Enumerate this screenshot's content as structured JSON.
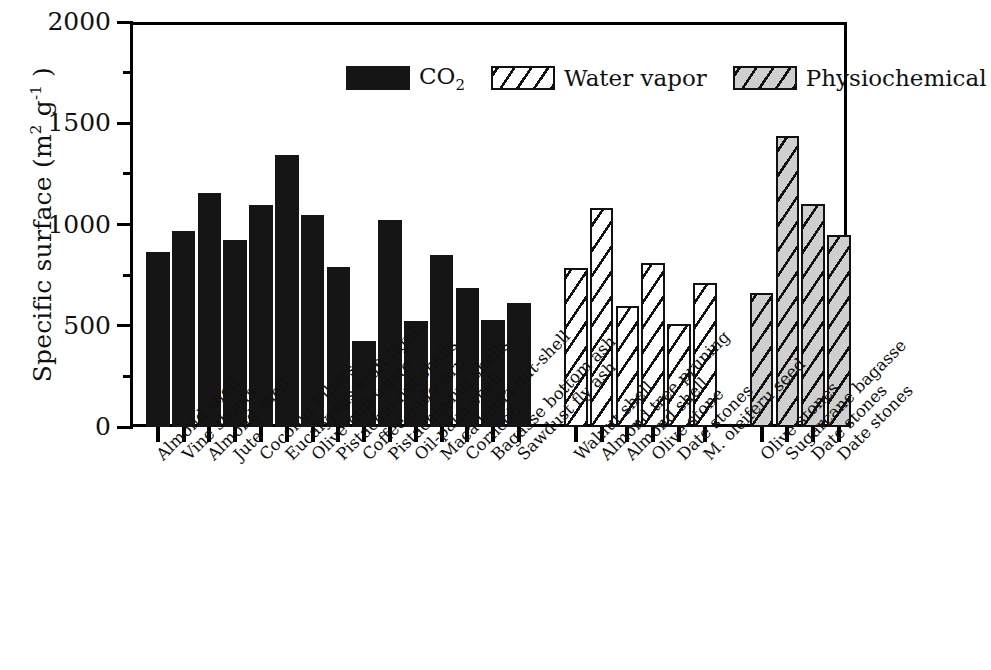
{
  "chart_data": {
    "type": "bar",
    "title": "",
    "xlabel": "",
    "ylabel": "Specific surface (m² g⁻¹)",
    "ylabel_main": "Specific surface (m",
    "ylabel_sup1": "2",
    "ylabel_mid": " g",
    "ylabel_sup2": "-1",
    "ylabel_end": " )",
    "ylim": [
      0,
      2000
    ],
    "yticks_major": [
      0,
      500,
      1000,
      1500,
      2000
    ],
    "yticks_minor": [
      250,
      750,
      1250,
      1750
    ],
    "ytick_labels": [
      "0",
      "500",
      "1000",
      "1500",
      "2000"
    ],
    "grid": false,
    "legend_position": "top-center",
    "series": [
      {
        "name": "CO2",
        "legend_label": "CO",
        "legend_sub": "2",
        "fill": "#151515",
        "pattern": "solid",
        "categories": [
          "Almond shell",
          "Vine shoots",
          "Almond shell",
          "Jute",
          "Coconut Fibers",
          "Eucalyptus kraft lignin",
          "Olive-mill waste",
          "Pistachio-nut shells",
          "Coffee endocarp",
          "Pistachio-nut shells",
          "Oil-palm-shell",
          "Macadamia nut-shell",
          "Corncob",
          "Bagasse bottom ash",
          "Sawdust fly ash"
        ],
        "values": [
          864,
          968,
          1156,
          923,
          1096,
          1343,
          1047,
          790,
          425,
          1022,
          523,
          849,
          686,
          528,
          612
        ]
      },
      {
        "name": "Water vapor",
        "legend_label": "Water vapor",
        "fill": "#ffffff",
        "pattern": "hatch",
        "categories": [
          "Walnut shell",
          "Almond tree pruning",
          "Almond shell",
          "Olive stone",
          "Date stones",
          "M. oleiferu seed"
        ],
        "values": [
          785,
          1081,
          598,
          810,
          509,
          711
        ]
      },
      {
        "name": "Physiochemical",
        "legend_label": "Physiochemical",
        "fill": "#cfcfcf",
        "pattern": "hatch-gray",
        "categories": [
          "Olive stones",
          "Sugarcane bagasse",
          "Date stones",
          "Date stones"
        ],
        "values": [
          660,
          1437,
          1100,
          950
        ]
      }
    ]
  },
  "legend": {
    "items": [
      {
        "label": "CO",
        "sub": "2",
        "style": "co2"
      },
      {
        "label": "Water vapor",
        "sub": "",
        "style": "wv"
      },
      {
        "label": "Physiochemical",
        "sub": "",
        "style": "pc"
      }
    ]
  },
  "axis": {
    "y_title_parts": [
      "Specific surface (m",
      "2",
      " g",
      "-1",
      " )"
    ]
  }
}
